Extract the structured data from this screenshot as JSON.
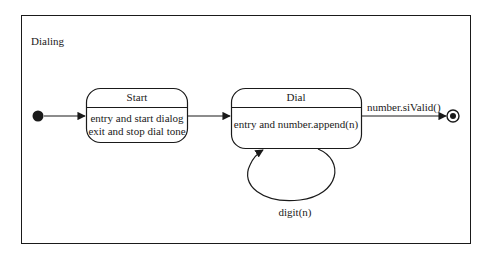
{
  "diagram": {
    "type": "uml-state-machine",
    "frame_label": "Dialing",
    "colors": {
      "stroke": "#1a1a1a",
      "background": "#ffffff"
    },
    "initial_state": {
      "kind": "initial-pseudostate"
    },
    "states": [
      {
        "id": "start",
        "name": "Start",
        "activities": [
          "entry and start dialog",
          "exit and stop dial tone"
        ]
      },
      {
        "id": "dial",
        "name": "Dial",
        "activities": [
          "entry and number.append(n)"
        ]
      }
    ],
    "final_state": {
      "kind": "final-state"
    },
    "transitions": [
      {
        "from": "initial",
        "to": "start",
        "label": ""
      },
      {
        "from": "start",
        "to": "dial",
        "label": ""
      },
      {
        "from": "dial",
        "to": "dial",
        "label": "digit(n)"
      },
      {
        "from": "dial",
        "to": "final",
        "label": "number.siValid()"
      }
    ]
  }
}
